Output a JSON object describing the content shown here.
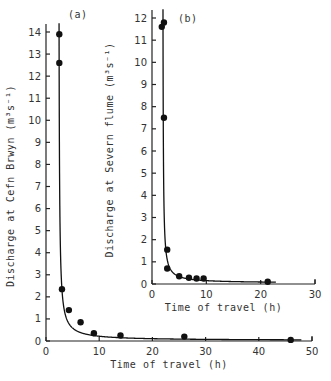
{
  "chart_data": [
    {
      "id": "a",
      "type": "scatter",
      "panel_label": "(a)",
      "title": "",
      "xlabel": "Time of travel   (h)",
      "ylabel": "Discharge at Cefn Brwyn   (m³s⁻¹)",
      "xlim": [
        0,
        50
      ],
      "ylim": [
        0,
        14
      ],
      "x_ticks": [
        0,
        10,
        20,
        30,
        40,
        50
      ],
      "y_ticks": [
        0,
        1,
        2,
        3,
        4,
        5,
        6,
        7,
        8,
        9,
        10,
        11,
        12,
        13,
        14
      ],
      "grid": false,
      "series": [
        {
          "name": "observed",
          "x": [
            2.5,
            2.5,
            3.0,
            4.3,
            6.5,
            9.0,
            14.0,
            26.0,
            46.0
          ],
          "y": [
            13.9,
            12.6,
            2.35,
            1.4,
            0.85,
            0.35,
            0.25,
            0.2,
            0.05
          ]
        },
        {
          "name": "fitted curve",
          "style": "line"
        }
      ]
    },
    {
      "id": "b",
      "type": "scatter",
      "panel_label": "(b)",
      "title": "",
      "xlabel": "Time of travel   (h)",
      "ylabel": "Discharge at Severn flume   (m³s⁻¹)",
      "xlim": [
        0,
        30
      ],
      "ylim": [
        0,
        12
      ],
      "x_ticks": [
        0,
        10,
        20,
        30
      ],
      "y_ticks": [
        0,
        1,
        2,
        3,
        4,
        5,
        6,
        7,
        8,
        9,
        10,
        11,
        12
      ],
      "grid": false,
      "series": [
        {
          "name": "observed",
          "x": [
            1.8,
            2.2,
            2.2,
            2.8,
            2.8,
            5.0,
            6.8,
            8.2,
            9.5,
            21.3
          ],
          "y": [
            11.6,
            11.8,
            7.5,
            1.55,
            0.7,
            0.35,
            0.28,
            0.25,
            0.25,
            0.1
          ]
        },
        {
          "name": "fitted curve",
          "style": "line"
        }
      ]
    }
  ],
  "labels": {
    "a_panel": "(a)",
    "b_panel": "(b)",
    "a_xlabel": "Time of travel   (h)",
    "b_xlabel": "Time of travel   (h)",
    "a_ylabel": "Discharge at Cefn Brwyn   (m³s⁻¹)",
    "b_ylabel": "Discharge at Severn flume   (m³s⁻¹)"
  }
}
